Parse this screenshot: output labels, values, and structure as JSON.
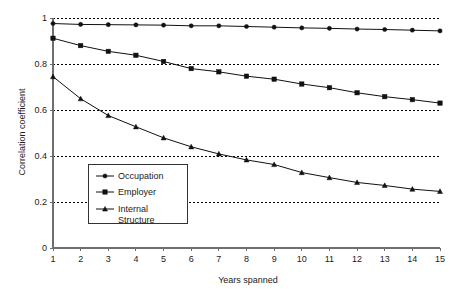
{
  "chart_data": {
    "type": "line",
    "title": "",
    "xlabel": "Years spanned",
    "ylabel": "Correlation coefficient",
    "x": [
      1,
      2,
      3,
      4,
      5,
      6,
      7,
      8,
      9,
      10,
      11,
      12,
      13,
      14,
      15
    ],
    "xtick_labels": [
      "1",
      "2",
      "3",
      "4",
      "5",
      "6",
      "7",
      "8",
      "9",
      "10",
      "11",
      "12",
      "13",
      "14",
      "15"
    ],
    "ytick_labels": [
      "0",
      "0.2",
      "0.4",
      "0.6",
      "0.8",
      "1"
    ],
    "ytick_values": [
      0,
      0.2,
      0.4,
      0.6,
      0.8,
      1
    ],
    "xlim": [
      1,
      15
    ],
    "ylim": [
      0,
      1
    ],
    "grid": "horizontal-dotted",
    "legend_position": "inside-lower-left",
    "series": [
      {
        "name": "Occupation",
        "marker": "circle",
        "values": [
          0.976,
          0.972,
          0.971,
          0.97,
          0.969,
          0.966,
          0.966,
          0.963,
          0.96,
          0.957,
          0.955,
          0.952,
          0.95,
          0.947,
          0.944
        ]
      },
      {
        "name": "Employer",
        "marker": "square",
        "values": [
          0.912,
          0.88,
          0.855,
          0.838,
          0.811,
          0.78,
          0.766,
          0.747,
          0.734,
          0.713,
          0.697,
          0.675,
          0.658,
          0.645,
          0.63
        ]
      },
      {
        "name": "Internal Structure",
        "marker": "triangle",
        "values": [
          0.745,
          0.649,
          0.576,
          0.527,
          0.479,
          0.44,
          0.409,
          0.383,
          0.363,
          0.328,
          0.306,
          0.285,
          0.272,
          0.256,
          0.246
        ]
      }
    ]
  },
  "legend": {
    "entries": [
      {
        "label": "Occupation",
        "label2": ""
      },
      {
        "label": "Employer",
        "label2": ""
      },
      {
        "label": "Internal",
        "label2": "Structure"
      }
    ]
  },
  "colors": {
    "line": "#111111",
    "grid": "#000000",
    "axis": "#6e6e6e",
    "background": "#ffffff"
  }
}
